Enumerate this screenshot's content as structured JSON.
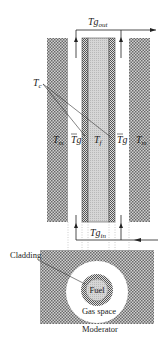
{
  "figure": {
    "type": "fuel-channel-cross-section",
    "labels": {
      "tg_out": "Tg",
      "tg_out_sub": "out",
      "tg_in": "Tg",
      "tg_in_sub": "in",
      "tc": "T",
      "tc_sub": "c",
      "tm_left": "T",
      "tm_left_sub": "m",
      "tm_right": "T",
      "tm_right_sub": "m",
      "tg_bar_left": "Tg",
      "tg_bar_right": "Tg",
      "tf": "T",
      "tf_sub": "f",
      "cladding": "Cladding",
      "fuel": "Fuel",
      "gas_space": "Gas space",
      "moderator": "Moderator"
    },
    "colors": {
      "moderator": "#8a8a8a",
      "cladding": "#9a9a9a",
      "fuel": "#c8c8c8",
      "line": "#333333"
    }
  }
}
